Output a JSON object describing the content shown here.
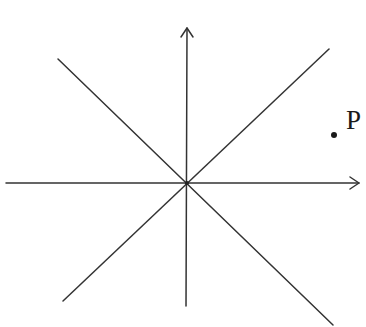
{
  "diagram": {
    "colors": {
      "stroke": "#333333",
      "background": "#ffffff",
      "point": "#1a1a1a"
    },
    "origin": {
      "x": 187,
      "y": 183
    },
    "axes": {
      "x_axis": {
        "x1": 6,
        "y1": 183,
        "x2": 359,
        "y2": 183,
        "arrow": "right"
      },
      "y_axis": {
        "x1": 186,
        "y1": 306,
        "x2": 187,
        "y2": 28,
        "arrow": "up"
      }
    },
    "lines": [
      {
        "name": "line-nw-se",
        "x1": 58,
        "y1": 59,
        "x2": 333,
        "y2": 325
      },
      {
        "name": "line-sw-ne",
        "x1": 63,
        "y1": 301,
        "x2": 329,
        "y2": 49
      }
    ],
    "point": {
      "label": "P",
      "x": 334,
      "y": 135,
      "r": 3
    }
  }
}
